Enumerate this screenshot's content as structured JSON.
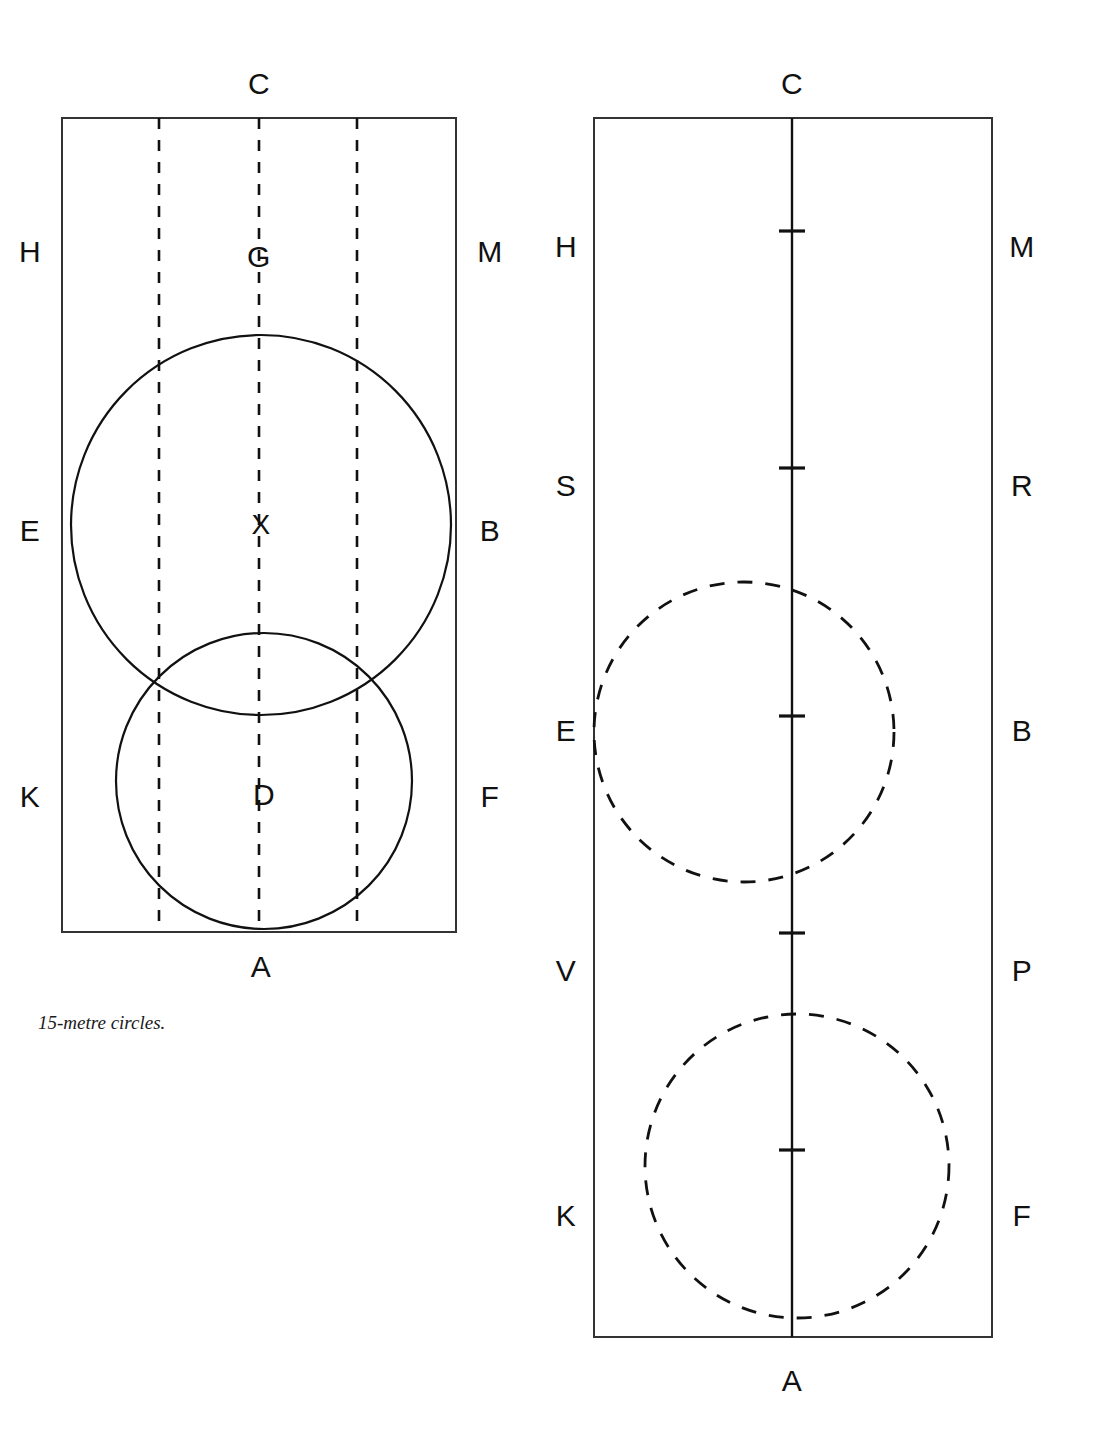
{
  "page": {
    "background_color": "#ffffff",
    "ink_color": "#111111",
    "width": 1094,
    "height": 1433
  },
  "caption": {
    "text": "15-metre circles."
  },
  "left_figure": {
    "name": "15-metre-circles-arena",
    "arena": {
      "x": 62,
      "y": 118,
      "width": 394,
      "height": 814,
      "stroke": "#333333",
      "stroke_width": 2,
      "style": "solid"
    },
    "quarter_lines": [
      {
        "name": "quarter-line-left",
        "x": 159,
        "style": "dashed"
      },
      {
        "name": "centre-line",
        "x": 259,
        "style": "dashed"
      },
      {
        "name": "quarter-line-right",
        "x": 357,
        "style": "dashed"
      }
    ],
    "circles": [
      {
        "name": "circle-at-x",
        "cx": 261,
        "cy": 525,
        "r": 190,
        "style": "solid",
        "centre_label": "X"
      },
      {
        "name": "circle-at-d",
        "cx": 264,
        "cy": 781,
        "r": 148,
        "style": "solid",
        "centre_label": "D"
      }
    ],
    "markers": [
      {
        "label": "C",
        "x": 259,
        "y": 84,
        "position": "top"
      },
      {
        "label": "H",
        "x": 30,
        "y": 252,
        "position": "left"
      },
      {
        "label": "G",
        "x": 259,
        "y": 257,
        "position": "inside"
      },
      {
        "label": "M",
        "x": 490,
        "y": 252,
        "position": "right"
      },
      {
        "label": "E",
        "x": 30,
        "y": 531,
        "position": "left"
      },
      {
        "label": "X",
        "x": 261,
        "y": 525,
        "position": "inside"
      },
      {
        "label": "B",
        "x": 490,
        "y": 531,
        "position": "right"
      },
      {
        "label": "K",
        "x": 30,
        "y": 797,
        "position": "left"
      },
      {
        "label": "D",
        "x": 264,
        "y": 795,
        "position": "inside"
      },
      {
        "label": "F",
        "x": 490,
        "y": 797,
        "position": "right"
      },
      {
        "label": "A",
        "x": 261,
        "y": 967,
        "position": "bottom"
      }
    ]
  },
  "right_figure": {
    "name": "20-metre-circles-arena",
    "arena": {
      "x": 594,
      "y": 118,
      "width": 398,
      "height": 1219,
      "stroke": "#333333",
      "stroke_width": 2,
      "style": "solid"
    },
    "centre_line": {
      "name": "centre-line",
      "x": 792,
      "y1": 118,
      "y2": 1337,
      "style": "solid",
      "stroke_width": 2.4
    },
    "centre_line_ticks": [
      {
        "name": "tick-d",
        "y": 231,
        "half_width": 13
      },
      {
        "name": "tick-l",
        "y": 468,
        "half_width": 13
      },
      {
        "name": "tick-x",
        "y": 716,
        "half_width": 13
      },
      {
        "name": "tick-i",
        "y": 933,
        "half_width": 13
      },
      {
        "name": "tick-g",
        "y": 1150,
        "half_width": 13
      }
    ],
    "circles": [
      {
        "name": "circle-upper",
        "cx": 744,
        "cy": 732,
        "r": 150,
        "style": "dashed"
      },
      {
        "name": "circle-lower",
        "cx": 797,
        "cy": 1166,
        "r": 152,
        "style": "dashed"
      }
    ],
    "markers": [
      {
        "label": "C",
        "x": 792,
        "y": 84,
        "position": "top"
      },
      {
        "label": "H",
        "x": 566,
        "y": 247,
        "position": "left"
      },
      {
        "label": "M",
        "x": 1022,
        "y": 247,
        "position": "right"
      },
      {
        "label": "S",
        "x": 566,
        "y": 486,
        "position": "left"
      },
      {
        "label": "R",
        "x": 1022,
        "y": 486,
        "position": "right"
      },
      {
        "label": "E",
        "x": 566,
        "y": 731,
        "position": "left"
      },
      {
        "label": "B",
        "x": 1022,
        "y": 731,
        "position": "right"
      },
      {
        "label": "V",
        "x": 566,
        "y": 971,
        "position": "left"
      },
      {
        "label": "P",
        "x": 1022,
        "y": 971,
        "position": "right"
      },
      {
        "label": "K",
        "x": 566,
        "y": 1216,
        "position": "left"
      },
      {
        "label": "F",
        "x": 1022,
        "y": 1216,
        "position": "right"
      },
      {
        "label": "A",
        "x": 792,
        "y": 1381,
        "position": "bottom"
      }
    ]
  },
  "caption_position": {
    "x": 38,
    "y": 1012
  }
}
